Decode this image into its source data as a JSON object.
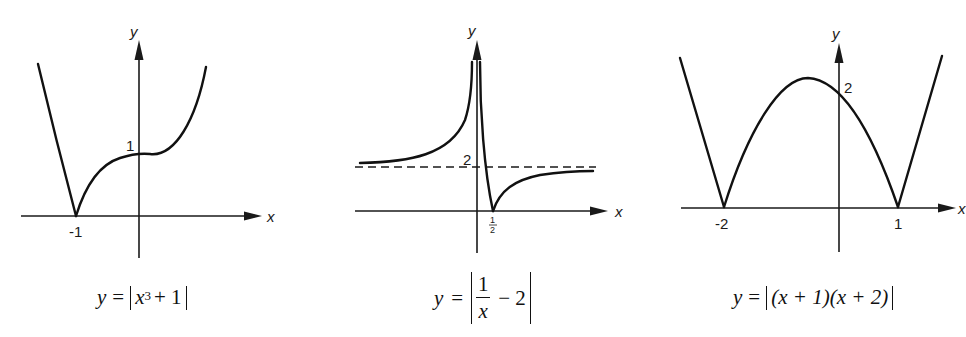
{
  "figure": {
    "graphs": [
      {
        "id": "graph-1",
        "caption": {
          "lhs": "y",
          "eq": "=",
          "base": "x",
          "exponent": "3",
          "rest": "+ 1"
        },
        "caption_text": "y = |x³ + 1|",
        "axis_labels": {
          "x": "x",
          "y": "y"
        },
        "tick_labels": {
          "x_neg1": "-1",
          "y_1": "1"
        },
        "key_points": [
          {
            "label": "-1",
            "x": -1,
            "y": 0,
            "type": "cusp"
          },
          {
            "label": "1",
            "x": 0,
            "y": 1,
            "type": "y-intercept"
          }
        ]
      },
      {
        "id": "graph-2",
        "caption": {
          "lhs": "y",
          "eq": "=",
          "numerator": "1",
          "denominator": "x",
          "rest": "− 2"
        },
        "caption_text": "y = |1/x − 2|",
        "axis_labels": {
          "x": "x",
          "y": "y"
        },
        "tick_labels": {
          "x_half_num": "1",
          "x_half_den": "2",
          "y_2": "2"
        },
        "asymptotes": [
          {
            "type": "horizontal",
            "y": 2,
            "style": "dashed"
          },
          {
            "type": "vertical",
            "x": 0
          }
        ],
        "key_points": [
          {
            "label": "1/2",
            "x": 0.5,
            "y": 0,
            "type": "cusp"
          }
        ]
      },
      {
        "id": "graph-3",
        "caption": {
          "lhs": "y",
          "eq": "=",
          "body": "(x + 1)(x + 2)"
        },
        "caption_text": "y = |(x + 1)(x + 2)|",
        "axis_labels": {
          "x": "x",
          "y": "y"
        },
        "tick_labels": {
          "x_neg2": "-2",
          "x_1": "1",
          "y_2": "2"
        },
        "key_points": [
          {
            "label": "-2",
            "x": -2,
            "y": 0,
            "type": "cusp"
          },
          {
            "label": "1",
            "x": 1,
            "y": 0,
            "type": "cusp"
          },
          {
            "label": "2",
            "x": 0,
            "y": 2,
            "type": "y-intercept"
          }
        ]
      }
    ]
  },
  "colors": {
    "background": "#ffffff",
    "ink": "#111111"
  }
}
